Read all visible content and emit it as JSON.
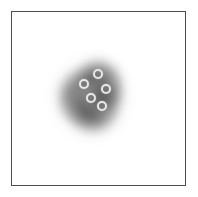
{
  "figure": {
    "title": "",
    "background_color": "#ffffff",
    "frame_color": "#4e4e4e",
    "frame_width_px": 1.5
  },
  "chart_data": {
    "type": "scatter",
    "title": "",
    "subtitle": "",
    "xlabel": "",
    "ylabel": "",
    "xlim": [
      0,
      175
    ],
    "ylim": [
      0,
      175
    ],
    "grid": false,
    "legend": null,
    "axis_ticks": {
      "x": [],
      "y": []
    },
    "annotations": [],
    "background_field": {
      "name": "diffuse-density-blob",
      "description": "Soft grayscale density cloud centered in the frame",
      "center": [
        80,
        86
      ],
      "extent": [
        82,
        88
      ],
      "peak_gray": "#464646",
      "edge_gray": "#ffffff",
      "colormap": "grayscale"
    },
    "markers": {
      "style": "open-ring",
      "ring_color": "#e8e8e8",
      "fill_color": "#7a7a7a",
      "count": 5,
      "radius_px": 5,
      "points": [
        {
          "id": "marker-1",
          "x": 72,
          "y": 72,
          "label": ""
        },
        {
          "id": "marker-2",
          "x": 86,
          "y": 62,
          "label": ""
        },
        {
          "id": "marker-3",
          "x": 94,
          "y": 77,
          "label": ""
        },
        {
          "id": "marker-4",
          "x": 79,
          "y": 86,
          "label": ""
        },
        {
          "id": "marker-5",
          "x": 90,
          "y": 94,
          "label": ""
        }
      ]
    }
  }
}
